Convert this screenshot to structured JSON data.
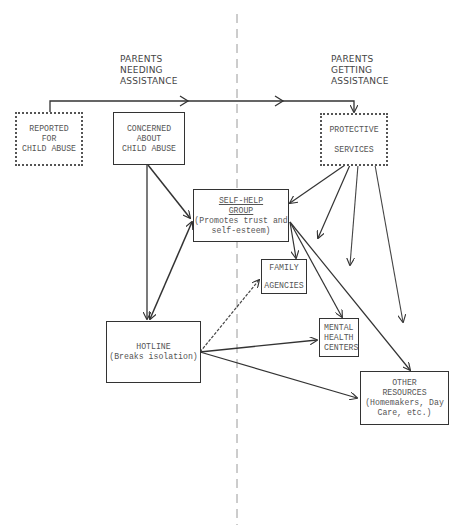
{
  "sections": {
    "left": {
      "line1": "Parents",
      "line2": "Needing",
      "line3": "Assistance"
    },
    "right": {
      "line1": "Parents",
      "line2": "Getting",
      "line3": "Assistance"
    }
  },
  "nodes": {
    "reported": {
      "line1": "REPORTED",
      "line2": "FOR",
      "line3": "CHILD ABUSE",
      "style": "dotted"
    },
    "concerned": {
      "line1": "CONCERNED",
      "line2": "ABOUT",
      "line3": "CHILD ABUSE",
      "style": "solid"
    },
    "protective": {
      "line1": "PROTECTIVE",
      "line2": "SERVICES",
      "style": "dotted"
    },
    "selfhelp": {
      "title1": "SELF-HELP",
      "title2": "GROUP",
      "desc1": "(Promotes trust and",
      "desc2": "self-esteem)",
      "style": "solid"
    },
    "family": {
      "line1": "FAMILY",
      "line2": "AGENCIES",
      "style": "solid"
    },
    "hotline": {
      "line1": "HOTLINE",
      "line2": "(Breaks isolation)",
      "style": "solid"
    },
    "mental": {
      "line1": "MENTAL",
      "line2": "HEALTH",
      "line3": "CENTERS",
      "style": "solid"
    },
    "other": {
      "line1": "OTHER",
      "line2": "RESOURCES",
      "line3": "(Homemakers, Day",
      "line4": "Care, etc.)",
      "style": "solid"
    }
  },
  "colors": {
    "line": "#333333",
    "divider": "#9a9a9a",
    "text": "#555555"
  }
}
